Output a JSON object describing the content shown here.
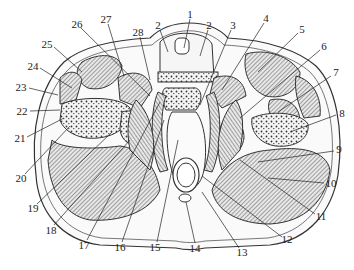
{
  "diagram": {
    "type": "anatomical cross-section",
    "labels": [
      {
        "id": "1",
        "text": "1",
        "x": 190,
        "y": 14
      },
      {
        "id": "2a",
        "text": "2",
        "x": 158,
        "y": 25
      },
      {
        "id": "2b",
        "text": "2",
        "x": 209,
        "y": 25
      },
      {
        "id": "3",
        "text": "3",
        "x": 233,
        "y": 25
      },
      {
        "id": "4",
        "text": "4",
        "x": 266,
        "y": 18
      },
      {
        "id": "5",
        "text": "5",
        "x": 302,
        "y": 29
      },
      {
        "id": "6",
        "text": "6",
        "x": 324,
        "y": 46
      },
      {
        "id": "7",
        "text": "7",
        "x": 336,
        "y": 72
      },
      {
        "id": "8",
        "text": "8",
        "x": 342,
        "y": 113
      },
      {
        "id": "9",
        "text": "9",
        "x": 339,
        "y": 149
      },
      {
        "id": "10",
        "text": "10",
        "x": 331,
        "y": 183
      },
      {
        "id": "11",
        "text": "11",
        "x": 321,
        "y": 216
      },
      {
        "id": "12",
        "text": "12",
        "x": 287,
        "y": 239
      },
      {
        "id": "13",
        "text": "13",
        "x": 242,
        "y": 252
      },
      {
        "id": "14",
        "text": "14",
        "x": 195,
        "y": 248
      },
      {
        "id": "15",
        "text": "15",
        "x": 155,
        "y": 247
      },
      {
        "id": "16",
        "text": "16",
        "x": 120,
        "y": 247
      },
      {
        "id": "17",
        "text": "17",
        "x": 84,
        "y": 245
      },
      {
        "id": "18",
        "text": "18",
        "x": 51,
        "y": 230
      },
      {
        "id": "19",
        "text": "19",
        "x": 33,
        "y": 208
      },
      {
        "id": "20",
        "text": "20",
        "x": 21,
        "y": 178
      },
      {
        "id": "21",
        "text": "21",
        "x": 20,
        "y": 138
      },
      {
        "id": "22",
        "text": "22",
        "x": 22,
        "y": 111
      },
      {
        "id": "23",
        "text": "23",
        "x": 21,
        "y": 87
      },
      {
        "id": "24",
        "text": "24",
        "x": 33,
        "y": 66
      },
      {
        "id": "25",
        "text": "25",
        "x": 47,
        "y": 44
      },
      {
        "id": "26",
        "text": "26",
        "x": 77,
        "y": 24
      },
      {
        "id": "27",
        "text": "27",
        "x": 106,
        "y": 19
      },
      {
        "id": "28",
        "text": "28",
        "x": 138,
        "y": 32
      }
    ]
  }
}
